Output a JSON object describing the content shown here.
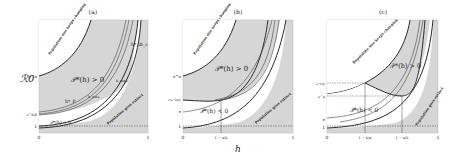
{
  "figure": {
    "shared_ylabel": "ℛ0",
    "shared_xlabel": "h",
    "panels": [
      {
        "id": "a",
        "title": "(a)",
        "x_ticks": [
          "0",
          "1"
        ],
        "y_ticks": [
          "e^a",
          "e^b/β",
          "1"
        ],
        "region_labels": {
          "positive": "𝒫*(h) > 0",
          "negative": "𝒫*(h) < 0",
          "top_left": "Population size keeps changing",
          "top_left_sub": "β < h̃ < ...",
          "bottom_right": "Population goes extinct"
        },
        "curve_labels": [
          "h*_P",
          "h_max",
          "h_max",
          "h*_c",
          "h_c"
        ]
      },
      {
        "id": "b",
        "title": "(b)",
        "x_ticks": [
          "0",
          "1 − a/b",
          "1"
        ],
        "y_ticks": [
          "e^a",
          "√(e^b/β)",
          "e",
          "1"
        ],
        "region_labels": {
          "positive": "𝒫*(h) > 0",
          "negative": "𝒫*(h) < 0",
          "top_left": "Population size keeps changing",
          "bottom_right": "Population goes extinct"
        }
      },
      {
        "id": "c",
        "title": "(c)",
        "x_ticks": [
          "0",
          "1 − b/a",
          "1 − a/b",
          "1"
        ],
        "y_ticks": [
          "e^b/β",
          "e^a",
          "e",
          "1"
        ],
        "region_labels": {
          "positive": "𝒫*(h) > 0",
          "negative": "𝒫*(h) < 0",
          "top_left": "Population size keeps changing",
          "bottom_right": "Population goes extinct"
        }
      }
    ]
  },
  "colors": {
    "shade": "#d4d4d4",
    "line": "#2a2a2a",
    "background": "#ffffff"
  }
}
